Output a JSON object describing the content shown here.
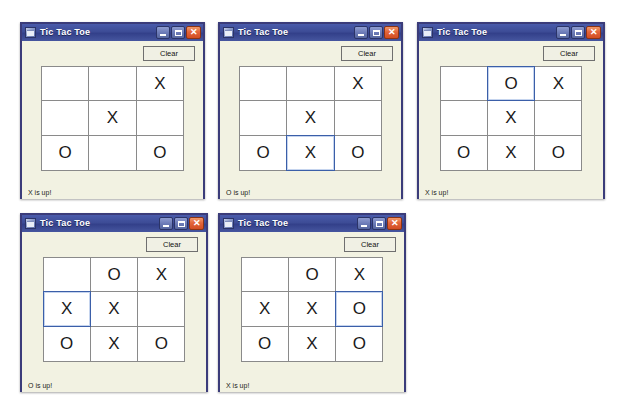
{
  "app": {
    "title": "Tic Tac Toe",
    "icon": "form-window-icon",
    "clear_label": "Clear",
    "titlebar_buttons": [
      {
        "name": "minimize-button",
        "glyph": "_"
      },
      {
        "name": "maximize-button",
        "glyph": "□"
      },
      {
        "name": "close-button",
        "glyph": "✕"
      }
    ],
    "colors": {
      "titlebar": "#3d4c96",
      "window_border": "#3b3c7a",
      "client_background": "#f2f2e2",
      "cell_background": "#ffffff",
      "cell_border": "#8a8a8a",
      "selected_cell_border": "#3b5fa8",
      "close_button": "#e2643a"
    }
  },
  "windows": [
    {
      "id": "window-1",
      "title": "Tic Tac Toe",
      "clear_label": "Clear",
      "status": "X is up!",
      "selected_cell": null,
      "cells": [
        "",
        "",
        "X",
        "",
        "X",
        "",
        "O",
        "",
        "O"
      ],
      "position": {
        "left": 20,
        "top": 22,
        "width": 185,
        "height": 177
      }
    },
    {
      "id": "window-2",
      "title": "Tic Tac Toe",
      "clear_label": "Clear",
      "status": "O is up!",
      "selected_cell": 7,
      "cells": [
        "",
        "",
        "X",
        "",
        "X",
        "",
        "O",
        "X",
        "O"
      ],
      "position": {
        "left": 218,
        "top": 22,
        "width": 185,
        "height": 177
      }
    },
    {
      "id": "window-3",
      "title": "Tic Tac Toe",
      "clear_label": "Clear",
      "status": "X is up!",
      "selected_cell": 1,
      "cells": [
        "",
        "O",
        "X",
        "",
        "X",
        "",
        "O",
        "X",
        "O"
      ],
      "position": {
        "left": 417,
        "top": 22,
        "width": 188,
        "height": 177
      }
    },
    {
      "id": "window-4",
      "title": "Tic Tac Toe",
      "clear_label": "Clear",
      "status": "O is up!",
      "selected_cell": 3,
      "cells": [
        "",
        "O",
        "X",
        "X",
        "X",
        "",
        "O",
        "X",
        "O"
      ],
      "position": {
        "left": 20,
        "top": 213,
        "width": 188,
        "height": 179
      }
    },
    {
      "id": "window-5",
      "title": "Tic Tac Toe",
      "clear_label": "Clear",
      "status": "X is up!",
      "selected_cell": 5,
      "cells": [
        "",
        "O",
        "X",
        "X",
        "X",
        "O",
        "O",
        "X",
        "O"
      ],
      "position": {
        "left": 218,
        "top": 213,
        "width": 188,
        "height": 179
      }
    }
  ]
}
